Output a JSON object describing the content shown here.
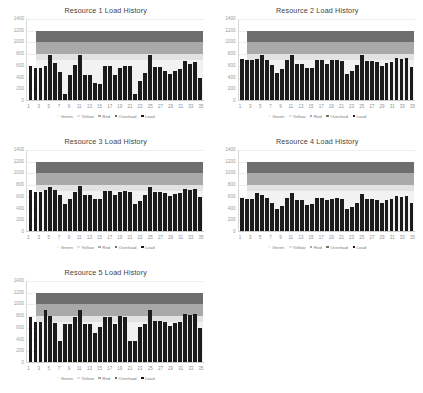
{
  "page": {
    "layout": "2-column grid of 5 bar charts",
    "background": "#ffffff"
  },
  "legend": {
    "items": [
      {
        "label": "Green",
        "color": "#f2f2f2"
      },
      {
        "label": "Yellow",
        "color": "#e2e2e2"
      },
      {
        "label": "Red",
        "color": "#a9a9a9"
      },
      {
        "label": "Overload",
        "color": "#6e6e6e"
      },
      {
        "label": "Load",
        "color": "#1b1b1b"
      }
    ]
  },
  "axes": {
    "yticks": [
      1400,
      1200,
      1000,
      800,
      600,
      400,
      200,
      0
    ],
    "ymin": 0,
    "ymax": 1400,
    "xticks": [
      1,
      3,
      5,
      7,
      9,
      11,
      13,
      15,
      17,
      19,
      21,
      23,
      25,
      27,
      29,
      31,
      33,
      35
    ],
    "xmin": 1,
    "xmax": 35
  },
  "bands": {
    "green": {
      "from": 0,
      "to": 700,
      "color": "#f2f2f2"
    },
    "yellow": {
      "from": 700,
      "to": 800,
      "color": "#e2e2e2"
    },
    "red": {
      "from": 800,
      "to": 1000,
      "color": "#a9a9a9"
    },
    "overload": {
      "from": 1000,
      "to": 1200,
      "color": "#6e6e6e"
    }
  },
  "chart_data": [
    {
      "type": "bar",
      "title": "Resource 1 Load History",
      "xlabel": "",
      "ylabel": "",
      "ylim": [
        0,
        1400
      ],
      "grid": true,
      "legend_position": "bottom",
      "categories": [
        1,
        2,
        3,
        4,
        5,
        6,
        7,
        8,
        9,
        10,
        11,
        12,
        13,
        14,
        15,
        16,
        17,
        18,
        19,
        20,
        21,
        22,
        23,
        24,
        25,
        26,
        27,
        28,
        29,
        30,
        31,
        32,
        33,
        34,
        35
      ],
      "series": [
        {
          "name": "Load",
          "color": "#1b1b1b",
          "values": [
            600,
            560,
            560,
            600,
            780,
            650,
            490,
            120,
            450,
            620,
            780,
            450,
            450,
            300,
            290,
            600,
            600,
            450,
            560,
            600,
            590,
            120,
            340,
            480,
            780,
            580,
            580,
            520,
            460,
            520,
            540,
            680,
            640,
            660,
            400
          ]
        }
      ]
    },
    {
      "type": "bar",
      "title": "Resource 2 Load History",
      "xlabel": "",
      "ylabel": "",
      "ylim": [
        0,
        1400
      ],
      "grid": true,
      "legend_position": "bottom",
      "categories": [
        1,
        2,
        3,
        4,
        5,
        6,
        7,
        8,
        9,
        10,
        11,
        12,
        13,
        14,
        15,
        16,
        17,
        18,
        19,
        20,
        21,
        22,
        23,
        24,
        25,
        26,
        27,
        28,
        29,
        30,
        31,
        32,
        33,
        34,
        35
      ],
      "series": [
        {
          "name": "Load",
          "color": "#1b1b1b",
          "values": [
            720,
            700,
            700,
            720,
            780,
            700,
            620,
            470,
            540,
            700,
            790,
            640,
            640,
            560,
            560,
            700,
            700,
            640,
            700,
            700,
            690,
            460,
            520,
            620,
            780,
            690,
            680,
            660,
            600,
            650,
            670,
            740,
            720,
            730,
            580
          ]
        }
      ]
    },
    {
      "type": "bar",
      "title": "Resource 3 Load History",
      "xlabel": "",
      "ylabel": "",
      "ylim": [
        0,
        1400
      ],
      "grid": true,
      "legend_position": "bottom",
      "categories": [
        1,
        2,
        3,
        4,
        5,
        6,
        7,
        8,
        9,
        10,
        11,
        12,
        13,
        14,
        15,
        16,
        17,
        18,
        19,
        20,
        21,
        22,
        23,
        24,
        25,
        26,
        27,
        28,
        29,
        30,
        31,
        32,
        33,
        34,
        35
      ],
      "series": [
        {
          "name": "Load",
          "color": "#1b1b1b",
          "values": [
            710,
            690,
            690,
            710,
            770,
            720,
            640,
            470,
            560,
            690,
            790,
            640,
            630,
            570,
            570,
            700,
            700,
            640,
            690,
            700,
            690,
            470,
            530,
            630,
            770,
            690,
            680,
            660,
            610,
            650,
            670,
            730,
            710,
            730,
            600
          ]
        }
      ]
    },
    {
      "type": "bar",
      "title": "Resource 4 Load History",
      "xlabel": "",
      "ylabel": "",
      "ylim": [
        0,
        1400
      ],
      "grid": true,
      "legend_position": "bottom",
      "categories": [
        1,
        2,
        3,
        4,
        5,
        6,
        7,
        8,
        9,
        10,
        11,
        12,
        13,
        14,
        15,
        16,
        17,
        18,
        19,
        20,
        21,
        22,
        23,
        24,
        25,
        26,
        27,
        28,
        29,
        30,
        31,
        32,
        33,
        34,
        35
      ],
      "series": [
        {
          "name": "Load",
          "color": "#1b1b1b",
          "values": [
            580,
            560,
            570,
            660,
            640,
            580,
            490,
            400,
            450,
            580,
            670,
            540,
            540,
            460,
            470,
            580,
            580,
            540,
            570,
            580,
            570,
            390,
            420,
            500,
            650,
            570,
            560,
            550,
            500,
            540,
            560,
            620,
            600,
            610,
            500
          ]
        }
      ]
    },
    {
      "type": "bar",
      "title": "Resource 5 Load History",
      "xlabel": "",
      "ylabel": "",
      "ylim": [
        0,
        1400
      ],
      "grid": true,
      "legend_position": "bottom",
      "categories": [
        1,
        2,
        3,
        4,
        5,
        6,
        7,
        8,
        9,
        10,
        11,
        12,
        13,
        14,
        15,
        16,
        17,
        18,
        19,
        20,
        21,
        22,
        23,
        24,
        25,
        26,
        27,
        28,
        29,
        30,
        31,
        32,
        33,
        34,
        35
      ],
      "series": [
        {
          "name": "Load",
          "color": "#1b1b1b",
          "values": [
            780,
            700,
            700,
            900,
            800,
            680,
            380,
            660,
            660,
            780,
            910,
            660,
            660,
            520,
            620,
            780,
            780,
            660,
            800,
            790,
            380,
            380,
            620,
            660,
            900,
            720,
            720,
            700,
            640,
            680,
            700,
            840,
            820,
            840,
            600
          ]
        }
      ]
    }
  ]
}
